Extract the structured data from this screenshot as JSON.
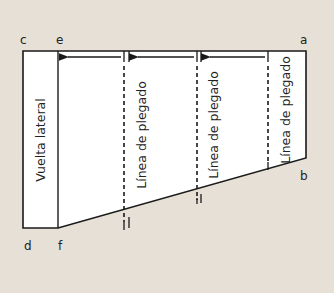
{
  "diagram": {
    "background_color": "#e7e0d7",
    "shape_fill": "#ffffff",
    "line_color": "#1a1a1a",
    "corner_labels": {
      "a": "a",
      "b": "b",
      "c": "c",
      "d": "d",
      "e": "e",
      "f": "f"
    },
    "side_panel_label": "Vuelta lateral",
    "fold_lines": [
      {
        "label": "Línea de plegado"
      },
      {
        "label": "Línea de plegado"
      },
      {
        "label": "Línea de plegado"
      }
    ]
  }
}
